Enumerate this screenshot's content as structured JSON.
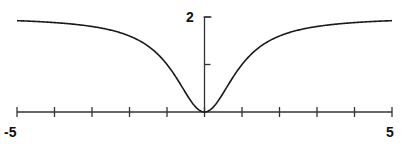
{
  "chart_data": {
    "type": "line",
    "title": "",
    "xlabel": "",
    "ylabel": "",
    "xlim": [
      -5,
      5
    ],
    "ylim": [
      0,
      2
    ],
    "grid": false,
    "legend": null,
    "x_ticks": [
      -5,
      -4,
      -3,
      -2,
      -1,
      0,
      1,
      2,
      3,
      4,
      5
    ],
    "x_tick_labels": {
      "-5": "-5",
      "5": "5"
    },
    "y_ticks": [
      1,
      2
    ],
    "y_tick_labels": {
      "2": "2"
    },
    "function": "y = 2x^2 / (1 + x^2)",
    "series": [
      {
        "name": "curve",
        "x": [
          -5,
          -4,
          -3,
          -2,
          -1.5,
          -1,
          -0.5,
          0,
          0.5,
          1,
          1.5,
          2,
          3,
          4,
          5
        ],
        "values": [
          1.92,
          1.88,
          1.8,
          1.6,
          1.38,
          1.0,
          0.4,
          0.0,
          0.4,
          1.0,
          1.38,
          1.6,
          1.8,
          1.88,
          1.92
        ]
      }
    ],
    "color": "#1a1a1a"
  },
  "labels": {
    "x_min": "-5",
    "x_max": "5",
    "y_top": "2"
  }
}
